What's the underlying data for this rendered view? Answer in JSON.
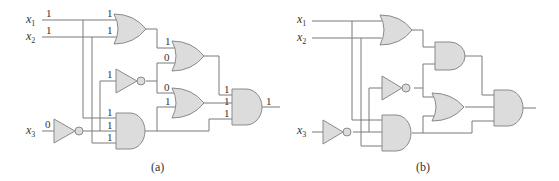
{
  "figure": {
    "panels": [
      {
        "id": "a",
        "caption": "(a)",
        "inputs": [
          {
            "name": "x",
            "sub": "1",
            "value": "1"
          },
          {
            "name": "x",
            "sub": "2",
            "value": "1"
          },
          {
            "name": "x",
            "sub": "3",
            "value": "0"
          }
        ],
        "values": {
          "or1_in1": "1",
          "or1_in2": "1",
          "or2_in1": "1",
          "or2_in2": "0",
          "not_top_in": "1",
          "or3_in1": "0",
          "or3_in2": "1",
          "and1_in1": "1",
          "and1_in2": "1",
          "and1_in3": "1",
          "and2_in1": "1",
          "and2_in2": "1",
          "and2_in3": "1",
          "output": "1"
        }
      },
      {
        "id": "b",
        "caption": "(b)",
        "inputs": [
          {
            "name": "x",
            "sub": "1"
          },
          {
            "name": "x",
            "sub": "2"
          },
          {
            "name": "x",
            "sub": "3"
          }
        ]
      }
    ],
    "colors": {
      "gate_fill": "#dcdcdc",
      "gate_stroke": "#8a8a8a",
      "wire": "#7a7a7a"
    }
  }
}
